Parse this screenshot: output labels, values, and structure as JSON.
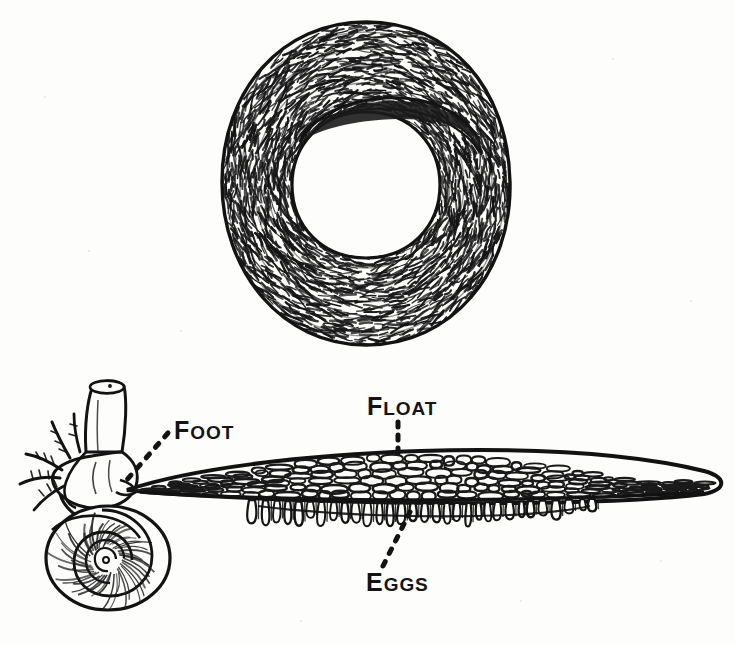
{
  "figure": {
    "kind": "scientific-line-illustration",
    "background_color": "#fdfdfc",
    "ink_color": "#141414",
    "width": 735,
    "height": 645
  },
  "labels": [
    {
      "id": "foot",
      "text": "FOOT",
      "initial": "F",
      "rest": "OOT",
      "leader": "dotted-diagonal-down-left",
      "points_to": "snail-foot"
    },
    {
      "id": "float",
      "text": "FLOAT",
      "initial": "F",
      "rest": "LOAT",
      "leader": "dotted-vertical-down",
      "points_to": "bubble-float"
    },
    {
      "id": "eggs",
      "text": "EGGS",
      "initial": "E",
      "rest": "GGS",
      "leader": "dotted-diagonal-up-right",
      "points_to": "egg-capsules"
    }
  ],
  "parts": {
    "egg_mass": {
      "name": "coiled egg mass",
      "shape": "ring",
      "texture": "dense hatched strokes"
    },
    "snail": {
      "name": "violet sea snail",
      "shell": "planispiral shell",
      "siphon": "open tubular siphon",
      "tentacles": "feathery cephalic lobes",
      "foot": "muscular foot"
    },
    "float": {
      "name": "bubble raft float",
      "texture": "polygonal bubble cells"
    },
    "eggs": {
      "name": "egg capsules",
      "texture": "teardrop capsules in fringe"
    }
  }
}
